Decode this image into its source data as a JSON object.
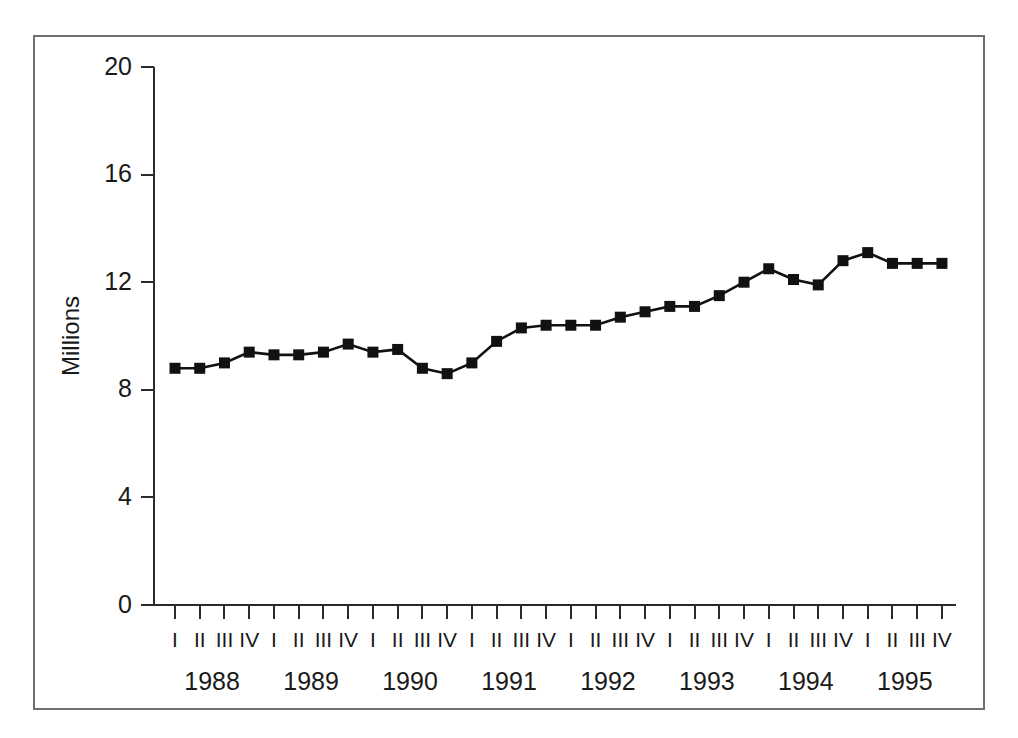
{
  "page": {
    "top_cut_text_artifact": " ",
    "background_color": "#ffffff",
    "frame_color": "#6f6f6f"
  },
  "chart_data": {
    "type": "line",
    "title": "",
    "subtitle": "",
    "xlabel": "",
    "ylabel": "Millions",
    "ylim": [
      0,
      20
    ],
    "ytick_labels": [
      "0",
      "4",
      "8",
      "12",
      "16",
      "20"
    ],
    "ytick_values": [
      0,
      4,
      8,
      12,
      16,
      20
    ],
    "grid": false,
    "legend": false,
    "legend_position": "none",
    "line_color": "#111111",
    "marker": "square",
    "marker_color": "#111111",
    "years": [
      "1988",
      "1989",
      "1990",
      "1991",
      "1992",
      "1993",
      "1994",
      "1995"
    ],
    "quarters": [
      "I",
      "II",
      "III",
      "IV"
    ],
    "categories": [
      "1988 I",
      "1988 II",
      "1988 III",
      "1988 IV",
      "1989 I",
      "1989 II",
      "1989 III",
      "1989 IV",
      "1990 I",
      "1990 II",
      "1990 III",
      "1990 IV",
      "1991 I",
      "1991 II",
      "1991 III",
      "1991 IV",
      "1992 I",
      "1992 II",
      "1992 III",
      "1992 IV",
      "1993 I",
      "1993 II",
      "1993 III",
      "1993 IV",
      "1994 I",
      "1994 II",
      "1994 III",
      "1994 IV",
      "1995 I",
      "1995 II",
      "1995 III",
      "1995 IV"
    ],
    "quarter_tick_labels": [
      "I",
      "II",
      "III",
      "IV",
      "I",
      "II",
      "III",
      "IV",
      "I",
      "II",
      "III",
      "IV",
      "I",
      "II",
      "III",
      "IV",
      "I",
      "II",
      "III",
      "IV",
      "I",
      "II",
      "III",
      "IV",
      "I",
      "II",
      "III",
      "IV",
      "I",
      "II",
      "III",
      "IV"
    ],
    "values": [
      8.8,
      8.8,
      9.0,
      9.4,
      9.3,
      9.3,
      9.4,
      9.7,
      9.4,
      9.5,
      8.8,
      8.6,
      9.0,
      9.8,
      10.3,
      10.4,
      10.4,
      10.4,
      10.7,
      10.9,
      11.1,
      11.1,
      11.5,
      12.0,
      12.5,
      12.1,
      11.9,
      12.8,
      13.1,
      12.7,
      12.7,
      12.7
    ]
  }
}
